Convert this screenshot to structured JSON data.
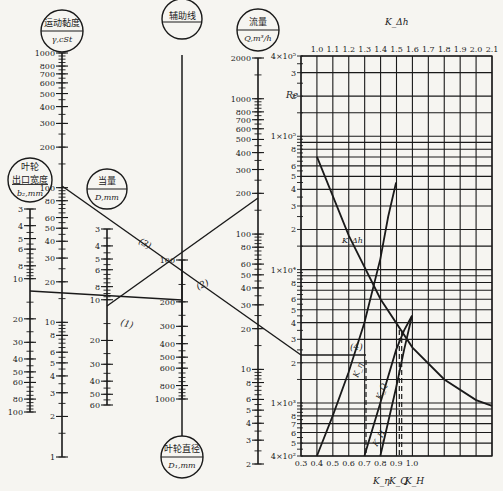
{
  "chart_data": {
    "type": "nomogram+line",
    "title": "",
    "nomogram": {
      "scales": [
        {
          "id": "b2",
          "title": "叶轮出口宽度",
          "unit": "b₂,mm",
          "ticks": [
            "3",
            "4",
            "5",
            "6",
            "8",
            "10",
            "20",
            "30",
            "40",
            "50",
            "60",
            "80",
            "100"
          ],
          "range": [
            3,
            100
          ],
          "direction": "down"
        },
        {
          "id": "viscosity",
          "title": "运动黏度",
          "unit": "γ,cSt",
          "ticks": [
            "1000",
            "800",
            "700",
            "600",
            "500",
            "400",
            "300",
            "200",
            "100",
            "80",
            "60",
            "50",
            "40",
            "30",
            "20",
            "10",
            "8",
            "6",
            "5",
            "4",
            "3",
            "2",
            "1"
          ],
          "range": [
            1,
            1000
          ],
          "direction": "up"
        },
        {
          "id": "equiv_d",
          "title": "当量",
          "unit": "D,mm",
          "ticks": [
            "3",
            "4",
            "5",
            "6",
            "8",
            "10",
            "20",
            "30",
            "40",
            "50",
            "60"
          ],
          "range": [
            3,
            60
          ],
          "direction": "down"
        },
        {
          "id": "aux",
          "title": "辅助线",
          "unit": "",
          "ticks": []
        },
        {
          "id": "d1",
          "title": "叶轮直径",
          "unit": "D₁,mm",
          "ticks": [
            "100",
            "200",
            "300",
            "400",
            "500",
            "600",
            "800",
            "1000"
          ],
          "range": [
            100,
            1000
          ],
          "direction": "down"
        },
        {
          "id": "flow",
          "title": "流量",
          "unit": "Q,m³/h",
          "ticks": [
            "2000",
            "1000",
            "800",
            "700",
            "600",
            "500",
            "400",
            "300",
            "200",
            "100",
            "80",
            "60",
            "50",
            "40",
            "30",
            "20",
            "10",
            "8",
            "6",
            "5",
            "4",
            "3",
            "2"
          ],
          "range": [
            2,
            2000
          ],
          "direction": "up"
        }
      ],
      "lines": [
        {
          "label": "(1)",
          "from": "b2=13",
          "to": "D1=300",
          "via": "D=11"
        },
        {
          "label": "(2)",
          "from": "D=11",
          "to": "Q=100",
          "via": "aux"
        },
        {
          "label": "(3)",
          "from": "γ=100",
          "to": "Q≈22",
          "via": "aux"
        },
        {
          "label": "(4)",
          "from": "Re≈2.5×10³",
          "to": "curves"
        }
      ]
    },
    "correction_chart": {
      "ylabel": "Re",
      "y_scale": "log",
      "ylim": [
        400,
        400000
      ],
      "y_major_ticks": [
        "4×10⁵",
        "3",
        "2",
        "1×10⁵",
        "8",
        "6",
        "5",
        "4",
        "3",
        "2",
        "1×10⁴",
        "8",
        "6",
        "5",
        "4",
        "3",
        "2",
        "1×10³",
        "8",
        "7",
        "6",
        "5",
        "4×10²"
      ],
      "top_axis": {
        "label": "K_Δh",
        "ticks": [
          "1.0",
          "1.1",
          "1.2",
          "1.3",
          "1.4",
          "1.5",
          "1.6",
          "1.7",
          "1.8",
          "1.9",
          "2.0",
          "2.1"
        ],
        "range": [
          1.0,
          2.1
        ]
      },
      "bottom_axis": {
        "labels": [
          "K_η",
          "K_Q",
          "K_H"
        ],
        "ticks": [
          "0.3",
          "0.4",
          "0.5",
          "0.6",
          "0.7",
          "0.8",
          "0.9",
          "1.0"
        ],
        "range": [
          0.3,
          1.0
        ]
      },
      "grid": true,
      "series": [
        {
          "name": "K_Δh",
          "axis": "top",
          "points": [
            [
              1.0,
              70000
            ],
            [
              1.2,
              18000
            ],
            [
              1.4,
              6000
            ],
            [
              1.6,
              2600
            ],
            [
              1.8,
              1500
            ],
            [
              2.0,
              1050
            ],
            [
              2.1,
              950
            ]
          ]
        },
        {
          "name": "K_η",
          "axis": "bottom",
          "points": [
            [
              0.4,
              400
            ],
            [
              0.5,
              800
            ],
            [
              0.6,
              1700
            ],
            [
              0.7,
              4000
            ],
            [
              0.8,
              12000
            ],
            [
              0.85,
              25000
            ],
            [
              0.9,
              45000
            ]
          ]
        },
        {
          "name": "K_Q",
          "axis": "bottom",
          "points": [
            [
              0.7,
              400
            ],
            [
              0.8,
              1000
            ],
            [
              0.9,
              2500
            ],
            [
              0.95,
              3500
            ],
            [
              1.0,
              4500
            ]
          ]
        },
        {
          "name": "K_H",
          "axis": "bottom",
          "points": [
            [
              0.8,
              400
            ],
            [
              0.9,
              1300
            ],
            [
              0.95,
              2500
            ],
            [
              1.0,
              4500
            ]
          ]
        }
      ],
      "annotations": [
        "(4)",
        "K_Δh",
        "K_η",
        "K_Q",
        "K_H"
      ]
    }
  },
  "labels": {
    "viscosity_title": "运动黏度",
    "viscosity_unit": "γ,cSt",
    "b2_title1": "叶轮",
    "b2_title2": "出口宽度",
    "b2_unit": "b₂,mm",
    "equiv_title": "当量",
    "equiv_unit": "D,mm",
    "aux_title": "辅助线",
    "flow_title": "流量",
    "flow_unit": "Q,m³/h",
    "d1_title": "叶轮直径",
    "d1_unit": "D₁,mm",
    "re_label": "Re",
    "kdh_label": "K_Δh",
    "line1": "(1)",
    "line2": "(2)",
    "line3": "(3)",
    "line4": "(4)",
    "k_eta": "K_η",
    "k_q": "K_Q",
    "k_h": "K_H",
    "curve_kdh": "K_Δh",
    "curve_keta": "K_η",
    "curve_kq": "K_Q",
    "curve_kh": "K_H"
  }
}
